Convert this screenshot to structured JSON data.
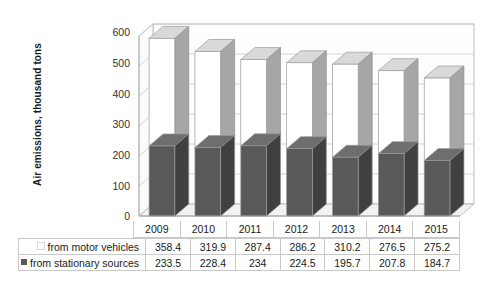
{
  "chart_data": {
    "type": "bar",
    "subtype": "stacked-column-3d",
    "title": "",
    "xlabel": "",
    "ylabel": "Air emissions, thousand tons",
    "ylim": [
      0,
      600
    ],
    "ytick_step": 100,
    "yticks": [
      "600",
      "500",
      "400",
      "300",
      "200",
      "100",
      "0"
    ],
    "grid": true,
    "grid_axis": "y",
    "legend_position": "data-table-row-labels",
    "categories": [
      "2009",
      "2010",
      "2011",
      "2012",
      "2013",
      "2014",
      "2015"
    ],
    "series": [
      {
        "name": "from motor vehicles",
        "values": [
          358.4,
          319.9,
          287.4,
          286.2,
          310.2,
          276.5,
          275.2
        ],
        "color": "#ffffff",
        "side_color": "#a6a6a6",
        "stack_order": 2
      },
      {
        "name": "from stationary sources",
        "values": [
          233.5,
          228.4,
          234,
          224.5,
          195.7,
          207.8,
          184.7
        ],
        "color": "#595959",
        "side_color": "#404040",
        "stack_order": 1
      }
    ],
    "totals": [
      591.9,
      548.3,
      521.4,
      510.7,
      505.9,
      484.3,
      459.9
    ]
  },
  "data_table": {
    "header": [
      "",
      "2009",
      "2010",
      "2011",
      "2012",
      "2013",
      "2014",
      "2015"
    ],
    "rows": [
      {
        "label": "from motor vehicles",
        "marker": "legend-swatch-light",
        "cells": [
          "358.4",
          "319.9",
          "287.4",
          "286.2",
          "310.2",
          "276.5",
          "275.2"
        ]
      },
      {
        "label": "from stationary sources",
        "marker": "legend-swatch-dark",
        "cells": [
          "233.5",
          "228.4",
          "234",
          "224.5",
          "195.7",
          "207.8",
          "184.7"
        ]
      }
    ]
  },
  "colors": {
    "stationary_front": "#595959",
    "stationary_side": "#404040",
    "stationary_top": "#6e6e6e",
    "vehicles_front": "#ffffff",
    "vehicles_side": "#a6a6a6",
    "vehicles_top": "#d9d9d9",
    "gridline": "#c9c9c9",
    "axis": "#b0b0b0",
    "wall": "#fdfdfd",
    "floor": "#f2f2f2",
    "text": "#1a1a1a"
  }
}
